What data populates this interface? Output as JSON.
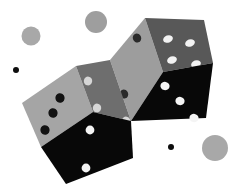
{
  "image": {
    "title": "Two tumbling dice illustration",
    "subject": "dice",
    "background_color": "#ffffff",
    "width": 240,
    "height": 192
  },
  "palette": {
    "background": "#ffffff",
    "face_light": "#9d9d9d",
    "face_light_2": "#a5a5a5",
    "face_mid": "#585858",
    "face_mid_2": "#6e6e6e",
    "face_dark": "#080808",
    "pip_dark": "#0a0a0a",
    "pip_light": "#f2f2f2",
    "pip_mid_light": "#d0d0d0",
    "bokeh_gray": "#a8a8a8",
    "bokeh_gray_2": "#9e9e9e",
    "dot_black": "#0d0d0d"
  },
  "dice": [
    {
      "name": "upper-right-die",
      "label": "Upper right die",
      "faces": [
        {
          "name": "left-face",
          "label": "Left face",
          "shade": "light",
          "fill": "#9d9d9d",
          "pip_color": "#2a2a2a",
          "pip_count": 2,
          "pips": [
            {
              "cx": 137,
              "cy": 38,
              "rx": 4.2,
              "ry": 4.6,
              "rot": -18
            },
            {
              "cx": 124,
              "cy": 94,
              "rx": 4.2,
              "ry": 4.6,
              "rot": -18
            }
          ],
          "polygon": "110,60 145,18 163,72 131,121"
        },
        {
          "name": "top-face",
          "label": "Top face",
          "shade": "mid",
          "fill": "#585858",
          "pip_color": "#f2f2f2",
          "pip_count": 4,
          "pips": [
            {
              "cx": 168,
              "cy": 39,
              "rx": 5.0,
              "ry": 3.6,
              "rot": -20
            },
            {
              "cx": 190,
              "cy": 43,
              "rx": 5.0,
              "ry": 3.6,
              "rot": -20
            },
            {
              "cx": 172,
              "cy": 60,
              "rx": 5.0,
              "ry": 3.6,
              "rot": -20
            },
            {
              "cx": 196,
              "cy": 64,
              "rx": 5.0,
              "ry": 3.6,
              "rot": -20
            }
          ],
          "polygon": "145,18 204,20 213,63 163,72"
        },
        {
          "name": "front-face",
          "label": "Front face",
          "shade": "dark",
          "fill": "#080808",
          "pip_color": "#f4f4f4",
          "pip_count": 3,
          "pips": [
            {
              "cx": 165,
              "cy": 86,
              "rx": 4.6,
              "ry": 4.2,
              "rot": 12
            },
            {
              "cx": 180,
              "cy": 101,
              "rx": 4.6,
              "ry": 4.2,
              "rot": 12
            },
            {
              "cx": 194,
              "cy": 118,
              "rx": 4.6,
              "ry": 4.2,
              "rot": 12
            }
          ],
          "polygon": "163,72 213,63 206,118 131,121"
        }
      ]
    },
    {
      "name": "lower-left-die",
      "label": "Lower left die",
      "faces": [
        {
          "name": "left-face",
          "label": "Left face",
          "shade": "light",
          "fill": "#a5a5a5",
          "pip_color": "#121212",
          "pip_count": 3,
          "pips": [
            {
              "cx": 60,
              "cy": 98,
              "rx": 4.6,
              "ry": 4.8,
              "rot": -12
            },
            {
              "cx": 53,
              "cy": 113,
              "rx": 4.6,
              "ry": 4.8,
              "rot": -12
            },
            {
              "cx": 45,
              "cy": 130,
              "rx": 4.6,
              "ry": 4.8,
              "rot": -12
            }
          ],
          "polygon": "22,103 76,66 93,112 41,147"
        },
        {
          "name": "right-face",
          "label": "Right face",
          "shade": "mid",
          "fill": "#6e6e6e",
          "pip_color": "#d6d6d6",
          "pip_count": 3,
          "pips": [
            {
              "cx": 88,
              "cy": 81,
              "rx": 4.2,
              "ry": 4.4,
              "rot": 8
            },
            {
              "cx": 97,
              "cy": 108,
              "rx": 4.2,
              "ry": 4.4,
              "rot": 8
            },
            {
              "cx": 126,
              "cy": 121,
              "rx": 4.2,
              "ry": 4.4,
              "rot": 8
            }
          ],
          "polygon": "76,66 110,60 131,121 93,112"
        },
        {
          "name": "front-face",
          "label": "Front face",
          "shade": "dark",
          "fill": "#080808",
          "pip_color": "#f4f4f4",
          "pip_count": 2,
          "pips": [
            {
              "cx": 90,
              "cy": 130,
              "rx": 4.4,
              "ry": 4.4,
              "rot": 0
            },
            {
              "cx": 86,
              "cy": 168,
              "rx": 4.4,
              "ry": 4.4,
              "rot": 0
            }
          ],
          "polygon": "41,147 93,112 131,121 133,158 66,184"
        }
      ]
    }
  ],
  "background_shapes": [
    {
      "name": "bokeh-circle-top-left",
      "label": "Top left gray circle",
      "cx": 31,
      "cy": 36,
      "r": 9.5,
      "fill": "#a8a8a8"
    },
    {
      "name": "bokeh-circle-top-center",
      "label": "Top center gray circle",
      "cx": 96,
      "cy": 22,
      "r": 11,
      "fill": "#9e9e9e"
    },
    {
      "name": "bokeh-circle-bottom-right",
      "label": "Bottom right gray circle",
      "cx": 215,
      "cy": 148,
      "r": 13,
      "fill": "#a8a8a8"
    },
    {
      "name": "dot-small-left",
      "label": "Small black dot left",
      "cx": 16,
      "cy": 70,
      "r": 3,
      "fill": "#0d0d0d"
    },
    {
      "name": "dot-small-bottom",
      "label": "Small black dot bottom",
      "cx": 171,
      "cy": 147,
      "r": 3,
      "fill": "#0d0d0d"
    }
  ]
}
